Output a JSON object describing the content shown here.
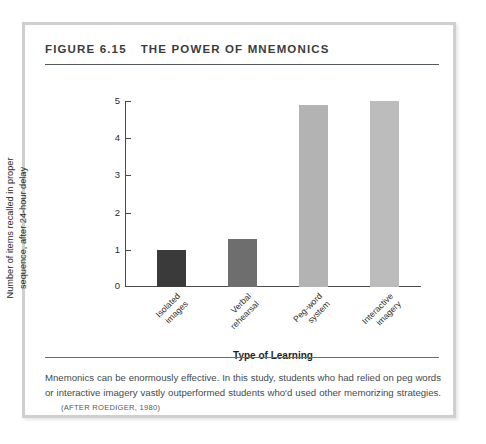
{
  "figure": {
    "number_label": "FIGURE 6.15",
    "title": "THE POWER OF MNEMONICS",
    "caption": "Mnemonics can be enormously effective. In this study, students who had relied on peg words or interactive imagery vastly outperformed students who'd used other memorizing strategies.",
    "source": "(AFTER ROEDIGER, 1980)"
  },
  "chart_data": {
    "type": "bar",
    "title": "THE POWER OF MNEMONICS",
    "categories": [
      "Isolated images",
      "Verbal rehearsal",
      "Peg-word system",
      "Interactive imagery"
    ],
    "values": [
      1.0,
      1.3,
      4.9,
      5.0
    ],
    "xlabel": "Type of Learning",
    "ylabel": "Number of items recalled in proper sequence, after 24-hour delay",
    "ylim": [
      0,
      5
    ],
    "yticks": [
      0,
      1,
      2,
      3,
      4,
      5
    ],
    "ytick_labels": [
      "0",
      "1",
      "2",
      "3",
      "4",
      "5"
    ],
    "grid": false,
    "legend": "none",
    "bar_colors": [
      "#3a3a3a",
      "#6e6e6e",
      "#b3b3b3",
      "#bcbcbc"
    ]
  },
  "axis": {
    "ytick_labels": [
      "5",
      "4",
      "3",
      "2",
      "1",
      "0"
    ],
    "xlabels": [
      "Isolated\nimages",
      "Verbal\nrehearsal",
      "Peg-word\nsystem",
      "Interactive\nimagery"
    ],
    "xtitle": "Type of Learning",
    "ytitle_line1": "Number of items recalled in proper",
    "ytitle_line2": "sequence, after 24-hour delay"
  },
  "colors": {
    "frame_border": "#cfcfcf",
    "rule_dark": "#555a5e",
    "axis_line": "#4a4a4a",
    "title_text": "#3c3c3c",
    "caption_text": "#444a4e"
  }
}
